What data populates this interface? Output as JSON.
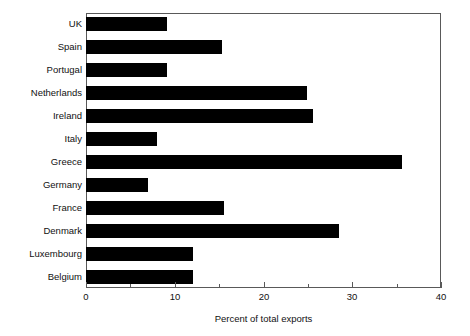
{
  "chart_data": {
    "type": "bar",
    "orientation": "horizontal",
    "title": "",
    "subtitle": "",
    "xlabel": "Percent of total exports",
    "ylabel": "",
    "xlim": [
      0,
      40
    ],
    "xticks": [
      0,
      10,
      20,
      30,
      40
    ],
    "xtick_labels": [
      "0",
      "10",
      "20",
      "30",
      "40"
    ],
    "xticks_minor": [
      5,
      15,
      25,
      35
    ],
    "grid": false,
    "legend": null,
    "bar_color": "#000000",
    "frame_color": "#595959",
    "background_color": "#ffffff",
    "categories": [
      "UK",
      "Spain",
      "Portugal",
      "Netherlands",
      "Ireland",
      "Italy",
      "Greece",
      "Germany",
      "France",
      "Denmark",
      "Luxembourg",
      "Belgium"
    ],
    "values": [
      9.1,
      15.3,
      9.1,
      24.9,
      25.6,
      8.0,
      35.6,
      7.0,
      15.5,
      28.5,
      12.0,
      12.0
    ]
  }
}
